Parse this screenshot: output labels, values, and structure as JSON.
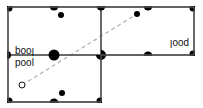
{
  "diagram": {
    "colors": {
      "border": "#555555",
      "pocket": "#000000",
      "ball": "#000000",
      "cue_ball_stroke": "#111111",
      "aim_line": "#b0b0b0",
      "background": "#ffffff"
    },
    "tables": [
      {
        "id": "original",
        "label": "pool",
        "orientation": "normal"
      },
      {
        "id": "reflection-top",
        "label": "pool",
        "orientation": "flipped-vertical"
      },
      {
        "id": "reflection-top-right",
        "label": "pool",
        "orientation": "rotated-180"
      }
    ],
    "balls": [
      {
        "id": "cue-ball",
        "type": "cue",
        "table": "original"
      },
      {
        "id": "object-ball",
        "type": "object",
        "table": "original"
      },
      {
        "id": "object-ball-reflection-1",
        "type": "object",
        "table": "reflection-top"
      },
      {
        "id": "object-ball-reflection-2",
        "type": "object",
        "table": "reflection-top-right"
      }
    ],
    "aim_line": {
      "style": "dashed",
      "from": "cue-ball",
      "to": "object-ball-reflection-2"
    }
  }
}
